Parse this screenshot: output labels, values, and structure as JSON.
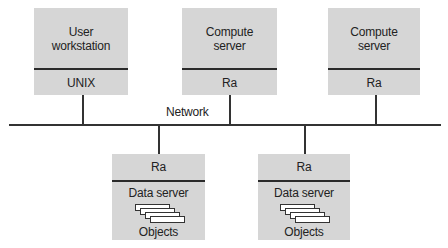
{
  "diagram": {
    "network": {
      "label": "Network"
    },
    "top_nodes": [
      {
        "id": "user-workstation",
        "title": "User\nworkstation",
        "title_lines": [
          "User",
          "workstation"
        ],
        "layer": "UNIX"
      },
      {
        "id": "compute-server-1",
        "title": "Compute\nserver",
        "title_lines": [
          "Compute",
          "server"
        ],
        "layer": "Ra"
      },
      {
        "id": "compute-server-2",
        "title": "Compute\nserver",
        "title_lines": [
          "Compute",
          "server"
        ],
        "layer": "Ra"
      }
    ],
    "bottom_nodes": [
      {
        "id": "data-server-1",
        "layer": "Ra",
        "title": "Data server",
        "content": "Objects"
      },
      {
        "id": "data-server-2",
        "layer": "Ra",
        "title": "Data server",
        "content": "Objects"
      }
    ],
    "colors": {
      "box_fill": "#d6d6d6",
      "line": "#333333",
      "text": "#222222",
      "background": "#ffffff"
    }
  }
}
